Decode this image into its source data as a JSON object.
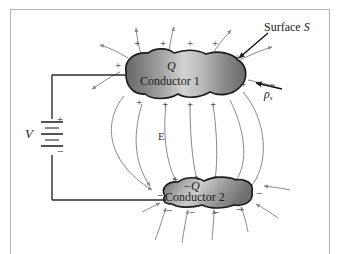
{
  "figure": {
    "background_color": "#ffffff",
    "border_color": "#b4b4b4"
  },
  "labels": {
    "surface": "Surface S",
    "surface_italic_part": "S",
    "charge_density": "ρ",
    "charge_density_sub": "s",
    "field": "E",
    "voltage": "V",
    "battery_plus": "+",
    "battery_minus": "−"
  },
  "conductors": [
    {
      "id": "conductor-1",
      "name": "Conductor 1",
      "charge_label": "Q",
      "polarity": "positive",
      "sign_glyph": "+",
      "fill_dark": "#6e6e6e",
      "fill_light": "#cfcfcf",
      "stroke": "#1a1a1a",
      "top_signs": [
        "+",
        "+",
        "+",
        "+"
      ],
      "bottom_signs": [
        "+",
        "+",
        "+",
        "+"
      ],
      "side_signs": [
        "+",
        "+",
        "+"
      ]
    },
    {
      "id": "conductor-2",
      "name": "Conductor 2",
      "charge_label": "−Q",
      "polarity": "negative",
      "sign_glyph": "−",
      "fill_dark": "#6e6e6e",
      "fill_light": "#c9c9c9",
      "stroke": "#1a1a1a",
      "top_signs": [
        "−",
        "−",
        "−",
        "−"
      ],
      "bottom_signs": [
        "−",
        "−",
        "−",
        "−"
      ],
      "side_signs": [
        "−",
        "−"
      ]
    }
  ],
  "circuit": {
    "source_type": "battery",
    "source_label": "V",
    "terminal_top": "+",
    "terminal_bottom": "−",
    "wire_color": "#2a2a2a"
  },
  "field_lines": {
    "color": "#8a8a8a",
    "arrow_direction": "from positive conductor to negative conductor",
    "count_between": 7,
    "count_outward_top": 5,
    "count_inward_bottom": 6
  }
}
